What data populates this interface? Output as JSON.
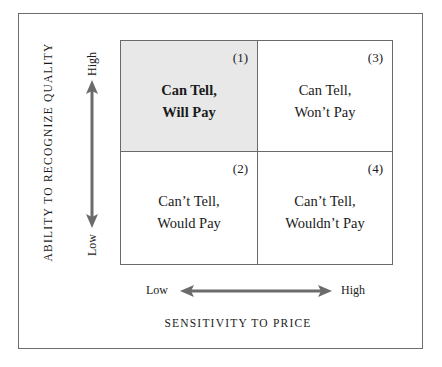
{
  "diagram": {
    "type": "2x2 matrix",
    "y_axis": {
      "title": "ABILITY TO RECOGNIZE QUALITY",
      "high_label": "High",
      "low_label": "Low"
    },
    "x_axis": {
      "title": "SENSITIVITY TO PRICE",
      "low_label": "Low",
      "high_label": "High"
    },
    "quadrants": [
      {
        "number": "(1)",
        "line1": "Can Tell,",
        "line2": "Will Pay",
        "position": "top-left",
        "shaded": true
      },
      {
        "number": "(3)",
        "line1": "Can Tell,",
        "line2": "Won’t Pay",
        "position": "top-right",
        "shaded": false
      },
      {
        "number": "(2)",
        "line1": "Can’t Tell,",
        "line2": "Would Pay",
        "position": "bottom-left",
        "shaded": false
      },
      {
        "number": "(4)",
        "line1": "Can’t Tell,",
        "line2": "Wouldn’t Pay",
        "position": "bottom-right",
        "shaded": false
      }
    ],
    "colors": {
      "shaded_cell": "#e8e8e8",
      "grid_line": "#6a6a6a",
      "arrow": "#6b6b6b",
      "text": "#1a1a1a"
    }
  }
}
